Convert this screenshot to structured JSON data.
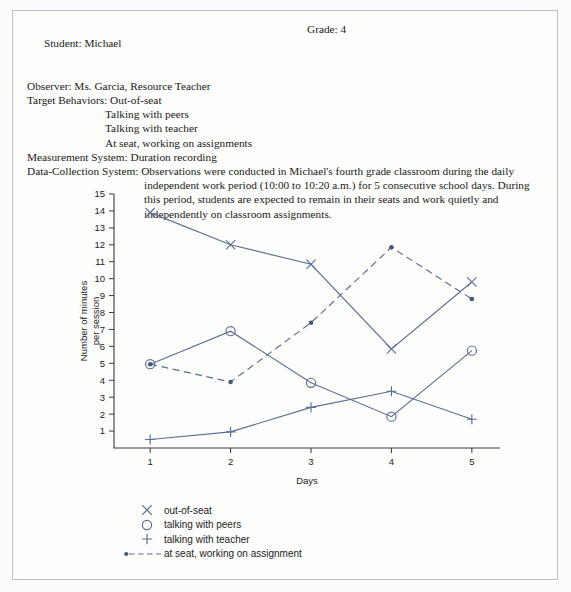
{
  "header": {
    "student_label": "Student: Michael",
    "grade_label": "Grade: 4",
    "observer_label": "Observer: Ms. Garcia, Resource Teacher",
    "target_behaviors_label": "Target Behaviors: Out-of-seat",
    "target_behavior_2": "Talking with peers",
    "target_behavior_3": "Talking with teacher",
    "target_behavior_4": "At seat, working on assignments",
    "measurement_label": "Measurement System: Duration recording",
    "data_collection_first": "Data-Collection System: Observations were conducted in Michael's fourth grade classroom during the daily",
    "data_collection_line2": "independent work period (10:00 to 10:20 a.m.) for 5 consecutive school days. During",
    "data_collection_line3": "this period, students are expected to remain in their seats and work quietly and",
    "data_collection_line4": "independently on classroom assignments."
  },
  "chart_data": {
    "type": "line",
    "title": "",
    "xlabel": "Days",
    "ylabel": "Number of minutes per session",
    "ylabel_line1": "Number of minutes",
    "ylabel_line2": "per session",
    "x": [
      1,
      2,
      3,
      4,
      5
    ],
    "xticklabels": [
      "1",
      "2",
      "3",
      "4",
      "5"
    ],
    "yticklabels": [
      "1",
      "2",
      "3",
      "4",
      "5",
      "6",
      "7",
      "8",
      "9",
      "10",
      "11",
      "12",
      "13",
      "14",
      "15"
    ],
    "yticks": [
      1,
      2,
      3,
      4,
      5,
      6,
      7,
      8,
      9,
      10,
      11,
      12,
      13,
      14,
      15
    ],
    "ylim": [
      0,
      15
    ],
    "xlim": [
      0.55,
      5.35
    ],
    "grid": false,
    "legend_position": "below-left",
    "accent_color": "#5b6f92",
    "series": [
      {
        "name": "out-of-seat",
        "marker": "x",
        "linestyle": "solid",
        "color": "#5b6f92",
        "values": [
          13.9,
          12.0,
          10.85,
          5.85,
          9.8
        ]
      },
      {
        "name": "talking with peers",
        "marker": "circle",
        "linestyle": "solid",
        "color": "#5b6f92",
        "values": [
          4.95,
          6.9,
          3.85,
          1.85,
          5.75
        ]
      },
      {
        "name": "talking with teacher",
        "marker": "plus",
        "linestyle": "solid",
        "color": "#5b6f92",
        "values": [
          0.5,
          0.95,
          2.4,
          3.35,
          1.7
        ]
      },
      {
        "name": "at seat, working on assignment",
        "marker": "dot",
        "linestyle": "dashed",
        "color": "#5b6f92",
        "values": [
          4.95,
          3.9,
          7.4,
          11.85,
          8.8
        ]
      }
    ]
  },
  "legend": {
    "items": [
      {
        "label": "out-of-seat",
        "marker": "x-marker"
      },
      {
        "label": "talking with peers",
        "marker": "circle-marker"
      },
      {
        "label": "talking with teacher",
        "marker": "plus-marker"
      },
      {
        "label": "at seat, working on assignment",
        "marker": "dashed-line-marker"
      }
    ]
  }
}
